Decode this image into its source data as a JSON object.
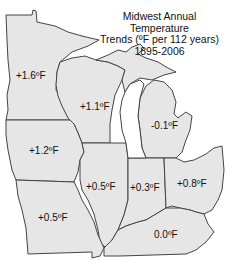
{
  "title": {
    "line1": "Midwest Annual Temperature",
    "line2": "Trends (ºF per 112 years)",
    "line3": "1895-2006"
  },
  "colors": {
    "state_fill": "#e6e6e6",
    "border": "#444444",
    "background": "#ffffff",
    "text": "#111111"
  },
  "states": [
    {
      "id": "minnesota",
      "label": "+1.6ºF"
    },
    {
      "id": "wisconsin",
      "label": "+1.1ºF"
    },
    {
      "id": "michigan",
      "label": "-0.1ºF"
    },
    {
      "id": "iowa",
      "label": "+1.2ºF"
    },
    {
      "id": "illinois",
      "label": "+0.5ºF"
    },
    {
      "id": "indiana",
      "label": "+0.3ºF"
    },
    {
      "id": "ohio",
      "label": "+0.8ºF"
    },
    {
      "id": "missouri",
      "label": "+0.5ºF"
    },
    {
      "id": "kentucky",
      "label": "0.0ºF"
    }
  ]
}
